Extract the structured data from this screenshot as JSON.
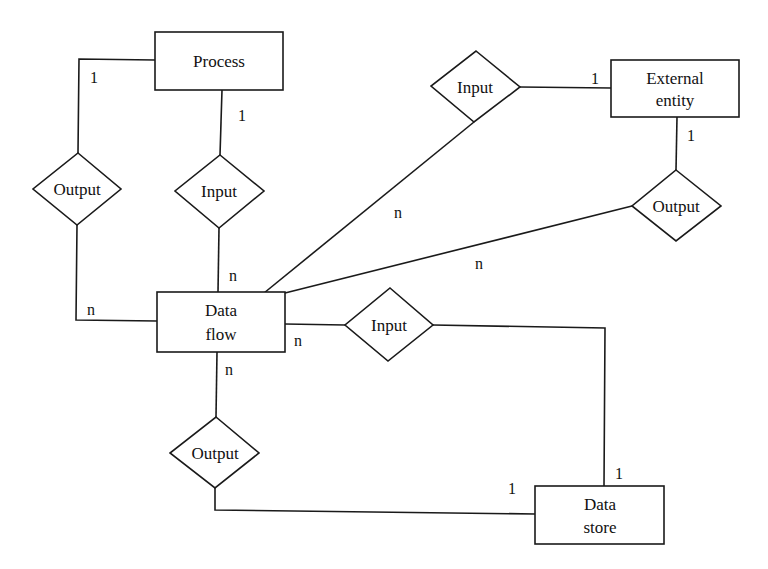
{
  "diagram": {
    "type": "entity-relationship",
    "entities": [
      {
        "id": "process",
        "lines": [
          "Process"
        ]
      },
      {
        "id": "external_entity",
        "lines": [
          "External",
          "entity"
        ]
      },
      {
        "id": "data_flow",
        "lines": [
          "Data",
          "flow"
        ]
      },
      {
        "id": "data_store",
        "lines": [
          "Data",
          "store"
        ]
      }
    ],
    "relationships": [
      {
        "id": "process_output",
        "label": "Output",
        "from": "Process",
        "to": "Data flow",
        "cardinality_from": "1",
        "cardinality_to": "n"
      },
      {
        "id": "process_input",
        "label": "Input",
        "from": "Process",
        "to": "Data flow",
        "cardinality_from": "1",
        "cardinality_to": "n"
      },
      {
        "id": "external_input",
        "label": "Input",
        "from": "External entity",
        "to": "Data flow",
        "cardinality_from": "1",
        "cardinality_to": "n"
      },
      {
        "id": "external_output",
        "label": "Output",
        "from": "External entity",
        "to": "Data flow",
        "cardinality_from": "1",
        "cardinality_to": "n"
      },
      {
        "id": "store_input",
        "label": "Input",
        "from": "Data store",
        "to": "Data flow",
        "cardinality_from": "1",
        "cardinality_to": "n"
      },
      {
        "id": "store_output",
        "label": "Output",
        "from": "Data store",
        "to": "Data flow",
        "cardinality_from": "1",
        "cardinality_to": "n"
      }
    ],
    "cardinality_labels": {
      "process_output_1": "1",
      "process_output_n": "n",
      "process_input_1": "1",
      "process_input_n": "n",
      "external_input_1": "1",
      "external_input_n": "n",
      "external_output_1": "1",
      "external_output_n": "n",
      "store_input_1": "1",
      "store_input_n": "n",
      "store_output_1": "1",
      "store_output_n": "n"
    },
    "colors": {
      "stroke": "#1a1a1a",
      "fill": "#ffffff",
      "text": "#111111"
    }
  }
}
